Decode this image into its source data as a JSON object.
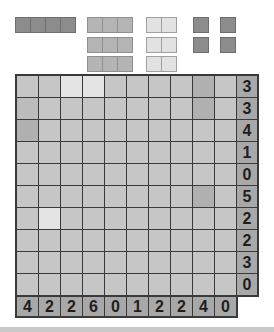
{
  "game": "battleship-puzzle",
  "fleet": [
    {
      "name": "battleship",
      "length": 4,
      "shade": "dark",
      "x": 15,
      "y": 17
    },
    {
      "name": "cruiser-1",
      "length": 3,
      "shade": "mid",
      "x": 87,
      "y": 17
    },
    {
      "name": "cruiser-2",
      "length": 3,
      "shade": "mid",
      "x": 87,
      "y": 37
    },
    {
      "name": "cruiser-3",
      "length": 3,
      "shade": "mid",
      "x": 87,
      "y": 56
    },
    {
      "name": "destroyer-1",
      "length": 2,
      "shade": "light",
      "x": 146,
      "y": 17
    },
    {
      "name": "destroyer-2",
      "length": 2,
      "shade": "light",
      "x": 146,
      "y": 37
    },
    {
      "name": "destroyer-3",
      "length": 2,
      "shade": "light",
      "x": 146,
      "y": 56
    },
    {
      "name": "submarine-1",
      "length": 1,
      "shade": "dark",
      "x": 193,
      "y": 17
    },
    {
      "name": "submarine-2",
      "length": 1,
      "shade": "dark",
      "x": 220,
      "y": 17
    },
    {
      "name": "submarine-3",
      "length": 1,
      "shade": "dark",
      "x": 193,
      "y": 37
    },
    {
      "name": "submarine-4",
      "length": 1,
      "shade": "dark",
      "x": 220,
      "y": 37
    }
  ],
  "grid": {
    "rows": 10,
    "cols": 10,
    "cells": [
      [
        "n",
        "n",
        "light",
        "light",
        "n",
        "n",
        "n",
        "n",
        "dark",
        "n"
      ],
      [
        "mid",
        "n",
        "n",
        "n",
        "n",
        "n",
        "n",
        "n",
        "dark",
        "n"
      ],
      [
        "dark",
        "n",
        "n",
        "n",
        "n",
        "n",
        "n",
        "n",
        "n",
        "n"
      ],
      [
        "n",
        "n",
        "n",
        "n",
        "n",
        "n",
        "n",
        "n",
        "n",
        "n"
      ],
      [
        "n",
        "n",
        "n",
        "n",
        "n",
        "n",
        "n",
        "n",
        "n",
        "n"
      ],
      [
        "n",
        "n",
        "n",
        "n",
        "n",
        "n",
        "n",
        "n",
        "dark",
        "n"
      ],
      [
        "n",
        "light",
        "n",
        "n",
        "n",
        "n",
        "n",
        "n",
        "n",
        "n"
      ],
      [
        "n",
        "n",
        "n",
        "n",
        "n",
        "n",
        "n",
        "n",
        "n",
        "n"
      ],
      [
        "n",
        "n",
        "n",
        "n",
        "n",
        "n",
        "n",
        "n",
        "n",
        "n"
      ],
      [
        "n",
        "n",
        "n",
        "n",
        "n",
        "n",
        "n",
        "n",
        "n",
        "n"
      ]
    ]
  },
  "row_clues": [
    "3",
    "3",
    "4",
    "1",
    "0",
    "5",
    "2",
    "2",
    "3",
    "0"
  ],
  "col_clues": [
    "4",
    "2",
    "2",
    "6",
    "0",
    "1",
    "2",
    "2",
    "4",
    "0"
  ],
  "colors": {
    "cell": "#c6c6c6",
    "cell_light": "#e4e4e4",
    "cell_dark": "#b0b0b0",
    "clue_bg": "#a8a8a8",
    "grid_line": "#3a3a3a"
  }
}
